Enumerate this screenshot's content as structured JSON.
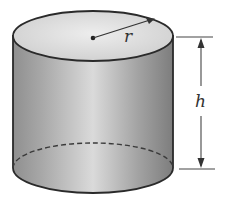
{
  "diagram": {
    "labels": {
      "radius": "r",
      "height": "h"
    },
    "colors": {
      "outline": "#2a2a2a",
      "body_dark": "#8c8c8c",
      "body_light": "#d6d6d6",
      "top_fill": "#e4e4e4",
      "background": "#ffffff"
    }
  }
}
